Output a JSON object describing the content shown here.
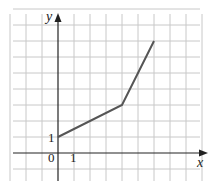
{
  "chart_data": {
    "type": "line",
    "title": "",
    "xlabel": "x",
    "ylabel": "y",
    "x": [
      0,
      4,
      6
    ],
    "series": [
      {
        "name": "piecewise linear",
        "values": [
          1,
          3,
          7
        ]
      }
    ],
    "tick_labels": {
      "origin": "0",
      "x_unit": "1",
      "y_unit": "1"
    },
    "xlim": [
      -3,
      9
    ],
    "ylim": [
      -1,
      9
    ],
    "grid": true,
    "legend": "none",
    "colors": {
      "line": "#555555",
      "grid": "#c8c8c8",
      "axis": "#222222"
    }
  },
  "labels": {
    "x_axis": "x",
    "y_axis": "y",
    "origin": "0",
    "x_one": "1",
    "y_one": "1"
  }
}
